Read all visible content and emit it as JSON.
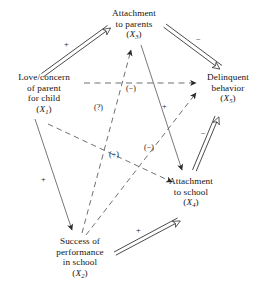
{
  "figure": {
    "type": "path-diagram",
    "background": "#ffffff",
    "line_color": "#2b2b2b",
    "text_color": "#141414",
    "width": 268,
    "height": 302
  },
  "nodes": [
    {
      "id": "X3",
      "name": "attachment-to-parents",
      "lines": [
        "Attachment",
        "to parents"
      ],
      "symbol": "X",
      "subscript": "3",
      "x": 134,
      "y": 22
    },
    {
      "id": "X1",
      "name": "love-concern-of-parent",
      "lines": [
        "Love/concern",
        "of parent",
        "for child"
      ],
      "symbol": "X",
      "subscript": "1",
      "x": 41,
      "y": 91
    },
    {
      "id": "X5",
      "name": "delinquent-behavior",
      "lines": [
        "Delinquent",
        "behavior"
      ],
      "symbol": "X",
      "subscript": "5",
      "x": 228,
      "y": 86
    },
    {
      "id": "X4",
      "name": "attachment-to-school",
      "lines": [
        "Attachment",
        "to school"
      ],
      "symbol": "X",
      "subscript": "4",
      "x": 190,
      "y": 190
    },
    {
      "id": "X2",
      "name": "success-of-performance-in-school",
      "lines": [
        "Success of",
        "performance",
        "in school"
      ],
      "symbol": "X",
      "subscript": "2",
      "x": 79,
      "y": 249
    }
  ],
  "edges": [
    {
      "id": "e1",
      "name": "edge-x1-to-x3",
      "from": "X1",
      "to": "X3",
      "style": "double-line",
      "arrow": "open",
      "sign": "+"
    },
    {
      "id": "e2",
      "name": "edge-x3-to-x5",
      "from": "X3",
      "to": "X5",
      "style": "double-line",
      "arrow": "open",
      "sign": "−"
    },
    {
      "id": "e3",
      "name": "edge-x4-to-x5",
      "from": "X4",
      "to": "X5",
      "style": "double-line",
      "arrow": "open",
      "sign": "−"
    },
    {
      "id": "e4",
      "name": "edge-x2-to-x4",
      "from": "X2",
      "to": "X4",
      "style": "double-line",
      "arrow": "open",
      "sign": "+"
    },
    {
      "id": "e5",
      "name": "edge-x1-to-x2",
      "from": "X1",
      "to": "X2",
      "style": "solid",
      "arrow": "solid",
      "sign": "+"
    },
    {
      "id": "e6",
      "name": "edge-x3-to-x4",
      "from": "X3",
      "to": "X4",
      "style": "solid",
      "arrow": "solid",
      "sign": "+"
    },
    {
      "id": "e7",
      "name": "edge-x1-to-x5",
      "from": "X1",
      "to": "X5",
      "style": "dashed",
      "arrow": "solid",
      "sign": "(−)"
    },
    {
      "id": "e8",
      "name": "edge-x2-to-x3",
      "from": "X2",
      "to": "X3",
      "style": "dashed",
      "arrow": "solid",
      "sign": "(?)"
    },
    {
      "id": "e9",
      "name": "edge-x1-to-x4",
      "from": "X1",
      "to": "X4",
      "style": "dashed",
      "arrow": "solid",
      "sign": "(+)"
    },
    {
      "id": "e10",
      "name": "edge-x2-to-x5",
      "from": "X2",
      "to": "X5",
      "style": "dashed",
      "arrow": "solid",
      "sign": "(−)"
    }
  ],
  "edge_labels": [
    {
      "id": "l1",
      "name": "label-x1-x3-plus",
      "text": "+",
      "x": 67,
      "y": 45,
      "edge": "e1"
    },
    {
      "id": "l2",
      "name": "label-x3-x5-minus",
      "text": "−",
      "x": 199,
      "y": 40,
      "edge": "e2"
    },
    {
      "id": "l3",
      "name": "label-x1-x5-minus",
      "text": "(−)",
      "x": 132,
      "y": 89,
      "edge": "e7"
    },
    {
      "id": "l4",
      "name": "label-x2-x3-question",
      "text": "(?)",
      "x": 100,
      "y": 108,
      "edge": "e8"
    },
    {
      "id": "l5",
      "name": "label-x3-x4-plus",
      "text": "+",
      "x": 164,
      "y": 107,
      "edge": "e6"
    },
    {
      "id": "l6",
      "name": "label-x4-x5-minus",
      "text": "−",
      "x": 204,
      "y": 134,
      "edge": "e3"
    },
    {
      "id": "l7",
      "name": "label-x1-x4-plus",
      "text": "(+)",
      "x": 115,
      "y": 155,
      "edge": "e9"
    },
    {
      "id": "l8",
      "name": "label-x2-x5-minus",
      "text": "(−)",
      "x": 150,
      "y": 148,
      "edge": "e10"
    },
    {
      "id": "l9",
      "name": "label-x1-x2-plus",
      "text": "+",
      "x": 43,
      "y": 180,
      "edge": "e5"
    },
    {
      "id": "l10",
      "name": "label-x2-x4-plus",
      "text": "+",
      "x": 138,
      "y": 231,
      "edge": "e4"
    }
  ]
}
